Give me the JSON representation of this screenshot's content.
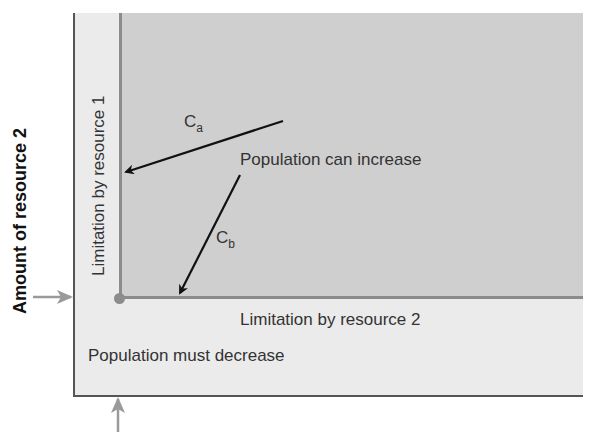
{
  "diagram": {
    "axis_y_label": "Amount of resource 2",
    "regions": {
      "increase_label": "Population can increase",
      "decrease_label": "Population must decrease"
    },
    "isoclines": {
      "resource1_label": "Limitation by resource 1",
      "resource2_label": "Limitation by resource 2"
    },
    "vectors": [
      {
        "name": "C",
        "subscript": "a",
        "from": [
          283,
          121
        ],
        "to": [
          122,
          173
        ]
      },
      {
        "name": "C",
        "subscript": "b",
        "from": [
          240,
          175
        ],
        "to": [
          178,
          296
        ]
      }
    ],
    "markers": {
      "y_threshold_arrow": "arrow pointing right at resource 2 threshold",
      "x_threshold_arrow": "arrow pointing up at resource 1 threshold"
    },
    "colors": {
      "inner_region": "#cfcfcf",
      "outer_region": "#ebebeb",
      "isocline": "#8c8c8c",
      "marker_arrow": "#9a9a9a",
      "vector_arrow": "#111111"
    }
  }
}
